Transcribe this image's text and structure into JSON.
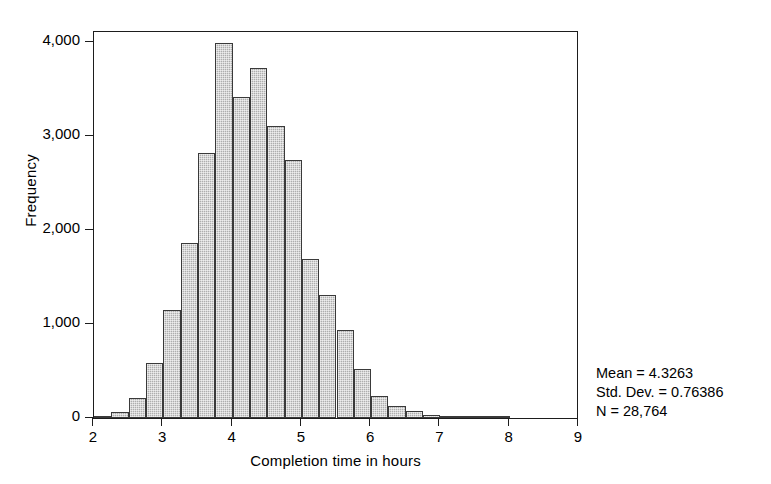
{
  "chart_data": {
    "type": "bar",
    "title": "",
    "xlabel": "Completion time in hours",
    "ylabel": "Frequency",
    "xlim": [
      2,
      9
    ],
    "ylim": [
      0,
      4200
    ],
    "grid": false,
    "legend": "none",
    "bin_width": 0.25,
    "xticks": [
      "2",
      "3",
      "4",
      "5",
      "6",
      "7",
      "8",
      "9"
    ],
    "xtick_values": [
      2,
      3,
      4,
      5,
      6,
      7,
      8,
      9
    ],
    "yticks": [
      "0",
      "1,000",
      "2,000",
      "3,000",
      "4,000"
    ],
    "ytick_values": [
      0,
      1000,
      2000,
      3000,
      4000
    ],
    "bin_starts": [
      2.0,
      2.25,
      2.5,
      2.75,
      3.0,
      3.25,
      3.5,
      3.75,
      4.0,
      4.25,
      4.5,
      4.75,
      5.0,
      5.25,
      5.5,
      5.75,
      6.0,
      6.25,
      6.5,
      6.75,
      7.0,
      7.25,
      7.5,
      7.75
    ],
    "categories": [
      "2.00-2.25",
      "2.25-2.50",
      "2.50-2.75",
      "2.75-3.00",
      "3.00-3.25",
      "3.25-3.50",
      "3.50-3.75",
      "3.75-4.00",
      "4.00-4.25",
      "4.25-4.50",
      "4.50-4.75",
      "4.75-5.00",
      "5.00-5.25",
      "5.25-5.50",
      "5.50-5.75",
      "5.75-6.00",
      "6.00-6.25",
      "6.25-6.50",
      "6.50-6.75",
      "6.75-7.00",
      "7.00-7.25",
      "7.25-7.50",
      "7.50-7.75",
      "7.75-8.00"
    ],
    "values": [
      20,
      60,
      210,
      580,
      1150,
      1860,
      2820,
      3990,
      3420,
      3720,
      3110,
      2750,
      1690,
      1310,
      940,
      520,
      230,
      130,
      70,
      35,
      15,
      8,
      4,
      2
    ],
    "annotations": [
      "Mean = 4.3263",
      "Std. Dev. = 0.76386",
      "N = 28,764"
    ],
    "bar_color": "#aeaeae",
    "bar_edge_color": "#3a3a3a",
    "axis_color": "#1d1d1d",
    "background": "#ffffff"
  },
  "stats": {
    "mean_line": "Mean = 4.3263",
    "stddev_line": "Std. Dev. = 0.76386",
    "n_line": "N = 28,764"
  }
}
